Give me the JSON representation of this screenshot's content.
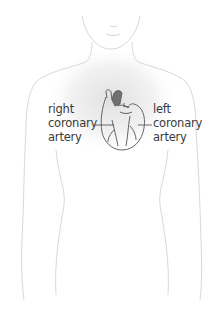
{
  "diagram": {
    "labels": {
      "right_coronary_artery": [
        "right",
        "coronary",
        "artery"
      ],
      "left_coronary_artery": [
        "left",
        "coronary",
        "artery"
      ]
    },
    "colors": {
      "body_outline": "#d4d4d4",
      "chest_shading": "#e6e6e6",
      "heart_outline": "#555555",
      "aorta_fill": "#707070",
      "label_text": "#3a3a3a",
      "leader_line": "#444444"
    }
  }
}
